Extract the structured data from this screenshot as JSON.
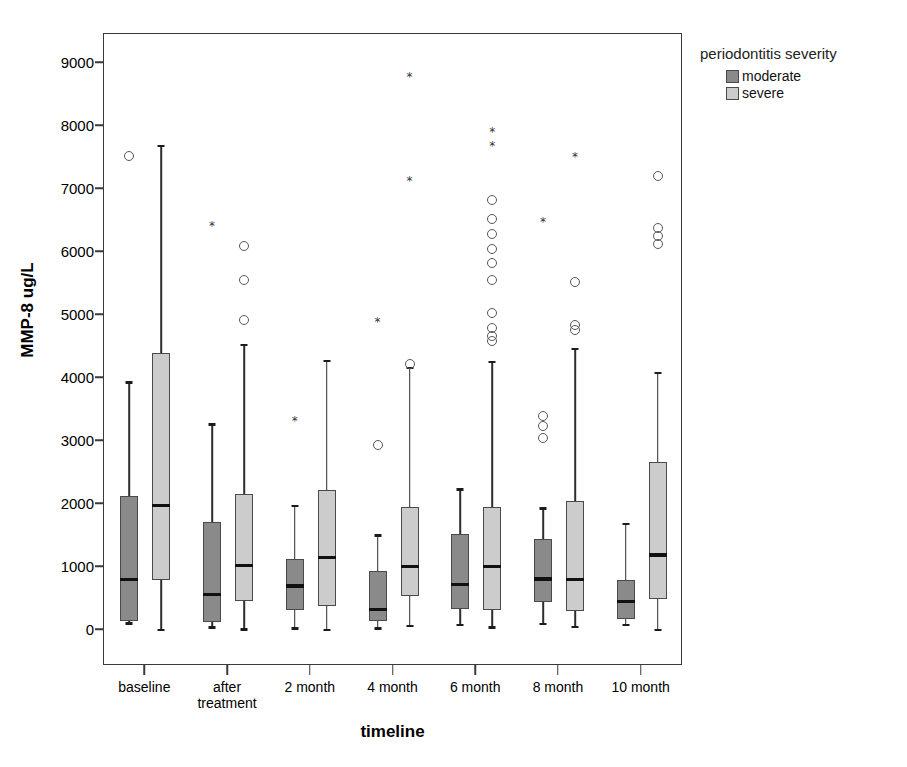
{
  "chart_data": {
    "type": "box",
    "title": "",
    "xlabel": "timeline",
    "ylabel": "MMP-8 ug/L",
    "ylim": [
      0,
      9500
    ],
    "yticks": [
      0,
      1000,
      2000,
      3000,
      4000,
      5000,
      6000,
      7000,
      8000,
      9000
    ],
    "ytick_labels": [
      "0",
      "1000",
      "2000",
      "3000",
      "4000",
      "5000",
      "6000",
      "7000",
      "8000",
      "9000"
    ],
    "grid": false,
    "categories": [
      "baseline",
      "after\ntreatment",
      "2 month",
      "4 month",
      "6 month",
      "8 month",
      "10 month"
    ],
    "legend": {
      "title": "periodontitis severity",
      "position": "right-top",
      "entries": [
        {
          "name": "moderate",
          "color": "#8a8a8a"
        },
        {
          "name": "severe",
          "color": "#cccccc"
        }
      ]
    },
    "series": [
      {
        "name": "moderate",
        "color": "#8a8a8a",
        "boxes": [
          {
            "category": "baseline",
            "whisker_low": 120,
            "q1": 150,
            "median": 800,
            "q3": 2120,
            "whisker_high": 3950,
            "outliers": [
              {
                "value": 7520,
                "type": "circle"
              }
            ]
          },
          {
            "category": "after treatment",
            "whisker_low": 60,
            "q1": 120,
            "median": 560,
            "q3": 1720,
            "whisker_high": 3280,
            "outliers": [
              {
                "value": 6420,
                "type": "star"
              }
            ]
          },
          {
            "category": "2 month",
            "whisker_low": 40,
            "q1": 310,
            "median": 700,
            "q3": 1120,
            "whisker_high": 1990,
            "outliers": [
              {
                "value": 3320,
                "type": "star"
              }
            ]
          },
          {
            "category": "4 month",
            "whisker_low": 40,
            "q1": 140,
            "median": 330,
            "q3": 930,
            "whisker_high": 1520,
            "outliers": [
              {
                "value": 4890,
                "type": "star"
              },
              {
                "value": 2930,
                "type": "circle"
              }
            ]
          },
          {
            "category": "6 month",
            "whisker_low": 100,
            "q1": 340,
            "median": 720,
            "q3": 1520,
            "whisker_high": 2250,
            "outliers": []
          },
          {
            "category": "8 month",
            "whisker_low": 110,
            "q1": 450,
            "median": 810,
            "q3": 1450,
            "whisker_high": 1950,
            "outliers": [
              {
                "value": 6480,
                "type": "star"
              },
              {
                "value": 3400,
                "type": "circle"
              },
              {
                "value": 3240,
                "type": "circle"
              },
              {
                "value": 3040,
                "type": "circle"
              }
            ]
          },
          {
            "category": "10 month",
            "whisker_low": 100,
            "q1": 180,
            "median": 450,
            "q3": 800,
            "whisker_high": 1700,
            "outliers": []
          }
        ]
      },
      {
        "name": "severe",
        "color": "#cccccc",
        "boxes": [
          {
            "category": "baseline",
            "whisker_low": 20,
            "q1": 790,
            "median": 1980,
            "q3": 4400,
            "whisker_high": 7700,
            "outliers": []
          },
          {
            "category": "after treatment",
            "whisker_low": 30,
            "q1": 460,
            "median": 1020,
            "q3": 2160,
            "whisker_high": 4540,
            "outliers": [
              {
                "value": 6100,
                "type": "circle"
              },
              {
                "value": 5550,
                "type": "circle"
              },
              {
                "value": 4920,
                "type": "circle"
              }
            ]
          },
          {
            "category": "2 month",
            "whisker_low": 20,
            "q1": 380,
            "median": 1150,
            "q3": 2230,
            "whisker_high": 4290,
            "outliers": []
          },
          {
            "category": "4 month",
            "whisker_low": 80,
            "q1": 540,
            "median": 1010,
            "q3": 1950,
            "whisker_high": 4180,
            "outliers": [
              {
                "value": 8780,
                "type": "star"
              },
              {
                "value": 7120,
                "type": "star"
              },
              {
                "value": 4230,
                "type": "circle"
              }
            ]
          },
          {
            "category": "6 month",
            "whisker_low": 60,
            "q1": 310,
            "median": 1010,
            "q3": 1950,
            "whisker_high": 4270,
            "outliers": [
              {
                "value": 7900,
                "type": "star"
              },
              {
                "value": 7680,
                "type": "star"
              },
              {
                "value": 6830,
                "type": "circle"
              },
              {
                "value": 6530,
                "type": "circle"
              },
              {
                "value": 6290,
                "type": "circle"
              },
              {
                "value": 6050,
                "type": "circle"
              },
              {
                "value": 5820,
                "type": "circle"
              },
              {
                "value": 5560,
                "type": "circle"
              },
              {
                "value": 5030,
                "type": "circle"
              },
              {
                "value": 4800,
                "type": "circle"
              },
              {
                "value": 4670,
                "type": "circle"
              },
              {
                "value": 4580,
                "type": "circle"
              }
            ]
          },
          {
            "category": "8 month",
            "whisker_low": 70,
            "q1": 300,
            "median": 800,
            "q3": 2050,
            "whisker_high": 4480,
            "outliers": [
              {
                "value": 7510,
                "type": "star"
              },
              {
                "value": 5520,
                "type": "circle"
              },
              {
                "value": 4840,
                "type": "circle"
              },
              {
                "value": 4760,
                "type": "circle"
              }
            ]
          },
          {
            "category": "10 month",
            "whisker_low": 20,
            "q1": 490,
            "median": 1190,
            "q3": 2670,
            "whisker_high": 4100,
            "outliers": [
              {
                "value": 7200,
                "type": "circle"
              },
              {
                "value": 6380,
                "type": "circle"
              },
              {
                "value": 6250,
                "type": "circle"
              },
              {
                "value": 6120,
                "type": "circle"
              }
            ]
          }
        ]
      }
    ]
  },
  "axis": {
    "y_title": "MMP-8 ug/L",
    "x_title": "timeline"
  },
  "legend_ui": {
    "title": "periodontitis severity",
    "moderate_label": "moderate",
    "severe_label": "severe"
  }
}
